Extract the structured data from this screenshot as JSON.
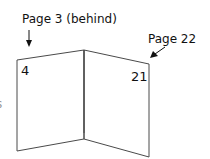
{
  "diagram": {
    "type": "folded-booklet-sheet",
    "labels": {
      "behind": "Page 3 (behind)",
      "right_page": "Page 22"
    },
    "page_numbers": {
      "left": "4",
      "right": "21"
    },
    "edge_fragment": "s",
    "colors": {
      "lines": "#4a4a4a",
      "text": "#111111",
      "background": "#ffffff"
    }
  }
}
